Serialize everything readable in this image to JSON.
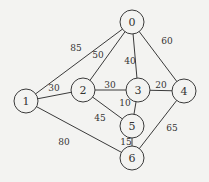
{
  "graph": {
    "type": "weighted-undirected-graph",
    "colors": {
      "background": "#f3f3f1",
      "stroke": "#3a3a3a",
      "text": "#333333"
    },
    "nodes": [
      {
        "id": "0",
        "label": "0",
        "x": 132,
        "y": 22
      },
      {
        "id": "1",
        "label": "1",
        "x": 26,
        "y": 101
      },
      {
        "id": "2",
        "label": "2",
        "x": 83,
        "y": 90
      },
      {
        "id": "3",
        "label": "3",
        "x": 138,
        "y": 90
      },
      {
        "id": "4",
        "label": "4",
        "x": 184,
        "y": 91
      },
      {
        "id": "5",
        "label": "5",
        "x": 132,
        "y": 126
      },
      {
        "id": "6",
        "label": "6",
        "x": 132,
        "y": 158
      }
    ],
    "edges": [
      {
        "from": "0",
        "to": "1",
        "weight": "85",
        "lx": 76,
        "ly": 51
      },
      {
        "from": "0",
        "to": "2",
        "weight": "50",
        "lx": 98,
        "ly": 58
      },
      {
        "from": "0",
        "to": "3",
        "weight": "40",
        "lx": 130,
        "ly": 64
      },
      {
        "from": "0",
        "to": "4",
        "weight": "60",
        "lx": 167,
        "ly": 44
      },
      {
        "from": "1",
        "to": "2",
        "weight": "30",
        "lx": 54,
        "ly": 91
      },
      {
        "from": "1",
        "to": "6",
        "weight": "80",
        "lx": 64,
        "ly": 145
      },
      {
        "from": "2",
        "to": "3",
        "weight": "30",
        "lx": 110,
        "ly": 88
      },
      {
        "from": "2",
        "to": "5",
        "weight": "45",
        "lx": 100,
        "ly": 121
      },
      {
        "from": "3",
        "to": "4",
        "weight": "20",
        "lx": 161,
        "ly": 88
      },
      {
        "from": "3",
        "to": "5",
        "weight": "10",
        "lx": 125,
        "ly": 106
      },
      {
        "from": "5",
        "to": "6",
        "weight": "15",
        "lx": 126,
        "ly": 145
      },
      {
        "from": "4",
        "to": "6",
        "weight": "65",
        "lx": 172,
        "ly": 131
      }
    ]
  }
}
